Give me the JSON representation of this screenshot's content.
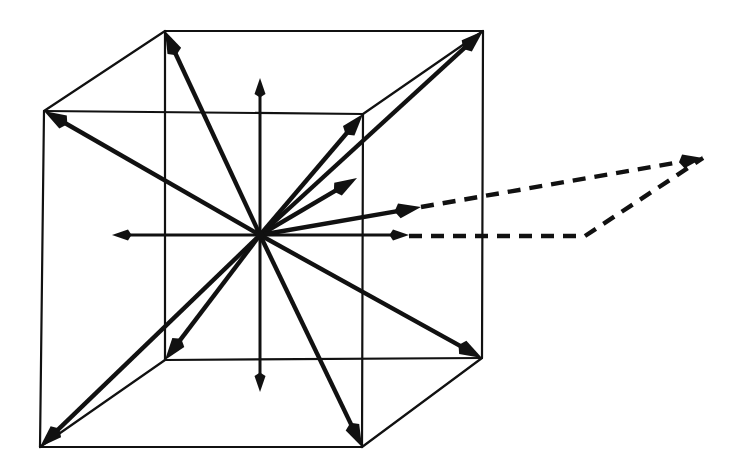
{
  "figure": {
    "kind": "line-drawing",
    "background_color": "#ffffff",
    "ink_color": "#111111",
    "canvas": {
      "width": 739,
      "height": 474
    }
  },
  "cube": {
    "label": "wireframe-cube",
    "stroke_width": 2.2,
    "vertices": {
      "front_top_left": [
        44,
        111
      ],
      "front_top_right": [
        363,
        114
      ],
      "front_bottom_left": [
        40,
        447
      ],
      "front_bottom_right": [
        362,
        447
      ],
      "back_top_left": [
        165,
        31
      ],
      "back_top_right": [
        483,
        31
      ],
      "back_bottom_left": [
        165,
        360
      ],
      "back_bottom_right": [
        482,
        358
      ]
    },
    "edges": [
      [
        "front_top_left",
        "front_top_right"
      ],
      [
        "front_top_right",
        "front_bottom_right"
      ],
      [
        "front_bottom_right",
        "front_bottom_left"
      ],
      [
        "front_bottom_left",
        "front_top_left"
      ],
      [
        "back_top_left",
        "back_top_right"
      ],
      [
        "back_top_right",
        "back_bottom_right"
      ],
      [
        "back_bottom_right",
        "back_bottom_left"
      ],
      [
        "back_bottom_left",
        "back_top_left"
      ],
      [
        "front_top_left",
        "back_top_left"
      ],
      [
        "front_top_right",
        "back_top_right"
      ],
      [
        "front_bottom_left",
        "back_bottom_left"
      ],
      [
        "front_bottom_right",
        "back_bottom_right"
      ]
    ]
  },
  "origin": {
    "label": "center-of-cube",
    "point": [
      260,
      235
    ]
  },
  "vectors": [
    {
      "name": "vector-up",
      "from": [
        260,
        235
      ],
      "to": [
        260,
        78
      ],
      "style": "solid",
      "weight": "thin"
    },
    {
      "name": "vector-down",
      "from": [
        260,
        235
      ],
      "to": [
        260,
        392
      ],
      "style": "solid",
      "weight": "thin"
    },
    {
      "name": "vector-left",
      "from": [
        260,
        235
      ],
      "to": [
        112,
        235
      ],
      "style": "solid",
      "weight": "thin"
    },
    {
      "name": "vector-right",
      "from": [
        260,
        235
      ],
      "to": [
        409,
        235
      ],
      "style": "solid",
      "weight": "thin"
    },
    {
      "name": "vector-back-top-left",
      "from": [
        260,
        235
      ],
      "to": [
        165,
        31
      ],
      "style": "solid",
      "weight": "bold"
    },
    {
      "name": "vector-back-top-right",
      "from": [
        260,
        235
      ],
      "to": [
        483,
        31
      ],
      "style": "solid",
      "weight": "bold"
    },
    {
      "name": "vector-front-top-left",
      "from": [
        260,
        235
      ],
      "to": [
        44,
        111
      ],
      "style": "solid",
      "weight": "bold"
    },
    {
      "name": "vector-front-top-right",
      "from": [
        260,
        235
      ],
      "to": [
        363,
        114
      ],
      "style": "solid",
      "weight": "bold"
    },
    {
      "name": "vector-front-bottom-left",
      "from": [
        260,
        235
      ],
      "to": [
        40,
        447
      ],
      "style": "solid",
      "weight": "bold"
    },
    {
      "name": "vector-front-bottom-right",
      "from": [
        260,
        235
      ],
      "to": [
        362,
        447
      ],
      "style": "solid",
      "weight": "bold"
    },
    {
      "name": "vector-back-bottom-left",
      "from": [
        260,
        235
      ],
      "to": [
        165,
        360
      ],
      "style": "solid",
      "weight": "bold"
    },
    {
      "name": "vector-back-bottom-right",
      "from": [
        260,
        235
      ],
      "to": [
        482,
        358
      ],
      "style": "solid",
      "weight": "bold"
    },
    {
      "name": "vector-right-face-mid",
      "from": [
        260,
        235
      ],
      "to": [
        357,
        178
      ],
      "style": "solid",
      "weight": "bold"
    },
    {
      "name": "vector-upper-right-out",
      "from": [
        260,
        235
      ],
      "to": [
        421,
        207
      ],
      "style": "solid",
      "weight": "bold"
    }
  ],
  "dashed_extensions": [
    {
      "name": "dashed-upper-extension",
      "points": [
        [
          421,
          207
        ],
        [
          703,
          158
        ]
      ],
      "arrowhead": true
    },
    {
      "name": "dashed-lower-extension",
      "points": [
        [
          409,
          236
        ],
        [
          585,
          236
        ],
        [
          703,
          158
        ]
      ],
      "arrowhead": false
    }
  ]
}
